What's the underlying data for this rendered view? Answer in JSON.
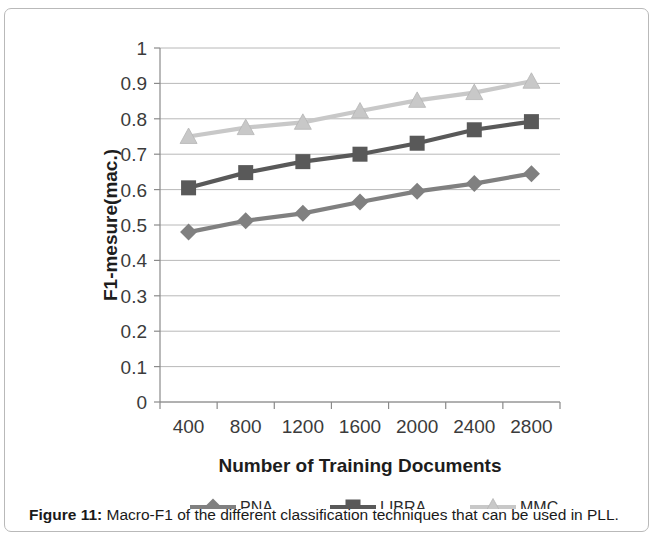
{
  "caption": {
    "label": "Figure 11:",
    "text": " Macro-F1 of the different classification techniques that can be used in PLL."
  },
  "chart_data": {
    "type": "line",
    "title": "",
    "xlabel": "Number of Training Documents",
    "ylabel": "F1-mesure(mac.)",
    "categories": [
      "400",
      "800",
      "1200",
      "1600",
      "2000",
      "2400",
      "2800"
    ],
    "yticks": [
      "0",
      "0.1",
      "0.2",
      "0.3",
      "0.4",
      "0.5",
      "0.6",
      "0.7",
      "0.8",
      "0.9",
      "1"
    ],
    "ylim": [
      0,
      1
    ],
    "grid": true,
    "legend_position": "bottom",
    "series": [
      {
        "name": "PNA",
        "values": [
          0.48,
          0.512,
          0.533,
          0.565,
          0.595,
          0.617,
          0.645
        ],
        "color": "#808080",
        "marker": "diamond"
      },
      {
        "name": "LIBRA",
        "values": [
          0.605,
          0.648,
          0.679,
          0.7,
          0.731,
          0.769,
          0.792
        ],
        "color": "#595959",
        "marker": "square"
      },
      {
        "name": "MMC",
        "values": [
          0.75,
          0.775,
          0.79,
          0.822,
          0.852,
          0.874,
          0.906
        ],
        "color": "#c8c8c8",
        "marker": "triangle"
      }
    ]
  }
}
